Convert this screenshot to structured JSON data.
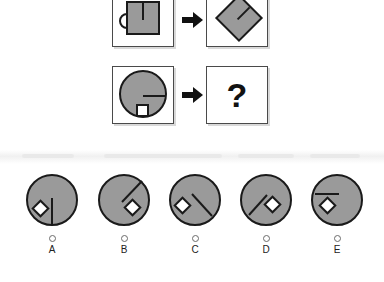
{
  "puzzle": {
    "type": "visual-analogy-matrix",
    "colors": {
      "shape_fill": "#9a9a9a",
      "shape_stroke": "#1a1a1a",
      "panel_border": "#4a4a4a",
      "panel_background": "#ffffff",
      "diamond_fill": "#ffffff",
      "arrow_color": "#111111",
      "page_background": "#ffffff"
    },
    "rows": [
      {
        "id": "row-example",
        "source": {
          "name": "mug-square",
          "description": "gray square with left handle and vertical line from top edge",
          "rotation_deg": 0
        },
        "arrow": "arrow-right",
        "target": {
          "name": "mug-square-rotated",
          "description": "same gray square rotated to a diamond with handle at upper left",
          "rotation_deg": 45
        }
      },
      {
        "id": "row-question",
        "source": {
          "name": "circle-line-square",
          "description": "gray circle with horizontal line from center to right edge and small white square below center",
          "rotation_deg": 0
        },
        "arrow": "arrow-right",
        "target": {
          "name": "answer-unknown",
          "label": "?"
        }
      }
    ],
    "options": [
      {
        "letter": "A",
        "line_angle_deg": 90,
        "diamond_angle_deg": 200,
        "description": "vertical line from center downward, white diamond lower left"
      },
      {
        "letter": "B",
        "line_angle_deg": -45,
        "diamond_angle_deg": 45,
        "description": "diagonal line up-right from center, white diamond lower right"
      },
      {
        "letter": "C",
        "line_angle_deg": 40,
        "diamond_angle_deg": 190,
        "description": "diagonal line down-right from center, white diamond left"
      },
      {
        "letter": "D",
        "line_angle_deg": 140,
        "diamond_angle_deg": 10,
        "description": "diagonal line down-left from center, white diamond right of center"
      },
      {
        "letter": "E",
        "line_angle_deg": 180,
        "diamond_angle_deg": 205,
        "description": "horizontal line from center to left edge, white diamond lower left"
      }
    ]
  }
}
